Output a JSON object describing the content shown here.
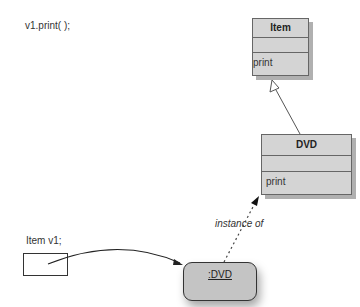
{
  "code": {
    "call": "v1.print( );",
    "declaration": "Item v1;"
  },
  "classes": [
    {
      "name": "Item",
      "operations": [
        "print"
      ]
    },
    {
      "name": "DVD",
      "operations": [
        "print"
      ]
    }
  ],
  "object": {
    "label": ":DVD"
  },
  "relations": {
    "instance_label": "instance of",
    "generalization": "DVD inherits Item"
  },
  "colors": {
    "class_fill": "#d4d4d4",
    "object_fill": "#c4c4c4",
    "line": "#333333"
  }
}
